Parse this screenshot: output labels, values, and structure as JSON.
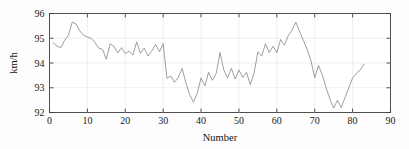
{
  "chart_data": {
    "type": "line",
    "title": "",
    "xlabel": "Number",
    "ylabel": "km/h",
    "xlim": [
      0,
      90
    ],
    "ylim": [
      92,
      96
    ],
    "xticks": [
      0,
      10,
      20,
      30,
      40,
      50,
      60,
      70,
      80,
      90
    ],
    "yticks": [
      92,
      93,
      94,
      95,
      96
    ],
    "grid": true,
    "legend": false,
    "line_color": "#8c8c8c",
    "axis_color": "#3d3d3d",
    "grid_color": "#e8e8ea",
    "background_color": "#ffffff",
    "series": [
      {
        "name": "speed",
        "x": [
          1,
          2,
          3,
          4,
          5,
          6,
          7,
          8,
          9,
          10,
          11,
          12,
          13,
          14,
          15,
          16,
          17,
          18,
          19,
          20,
          21,
          22,
          23,
          24,
          25,
          26,
          27,
          28,
          29,
          30,
          31,
          32,
          33,
          34,
          35,
          36,
          37,
          38,
          39,
          40,
          41,
          42,
          43,
          44,
          45,
          46,
          47,
          48,
          49,
          50,
          51,
          52,
          53,
          54,
          55,
          56,
          57,
          58,
          59,
          60,
          61,
          62,
          63,
          64,
          65,
          66,
          67,
          68,
          69,
          70,
          71,
          72,
          73,
          74,
          75,
          76,
          77,
          78,
          79,
          80,
          81,
          82,
          83
        ],
        "values": [
          94.82,
          94.68,
          94.62,
          94.92,
          95.12,
          95.65,
          95.58,
          95.3,
          95.12,
          95.05,
          95.0,
          94.82,
          94.6,
          94.55,
          94.15,
          94.78,
          94.68,
          94.4,
          94.62,
          94.38,
          94.48,
          94.32,
          94.85,
          94.4,
          94.6,
          94.28,
          94.48,
          94.75,
          94.45,
          94.78,
          93.38,
          93.48,
          93.22,
          93.42,
          93.78,
          93.2,
          92.72,
          92.42,
          92.78,
          93.4,
          93.08,
          93.62,
          93.3,
          93.58,
          94.42,
          93.72,
          93.4,
          93.78,
          93.35,
          93.72,
          93.42,
          93.62,
          93.12,
          93.6,
          94.45,
          94.28,
          94.78,
          94.42,
          94.68,
          94.42,
          94.95,
          94.72,
          95.1,
          95.32,
          95.65,
          95.28,
          94.92,
          94.55,
          94.1,
          93.4,
          93.9,
          93.52,
          93.0,
          92.55,
          92.18,
          92.5,
          92.2,
          92.6,
          93.0,
          93.4,
          93.58,
          93.72,
          93.95
        ]
      }
    ]
  },
  "axes": {
    "x_title": "Number",
    "y_title": "km/h",
    "x_tick_labels": [
      "0",
      "10",
      "20",
      "30",
      "40",
      "50",
      "60",
      "70",
      "80",
      "90"
    ],
    "y_tick_labels": [
      "92",
      "93",
      "94",
      "95",
      "96"
    ]
  }
}
